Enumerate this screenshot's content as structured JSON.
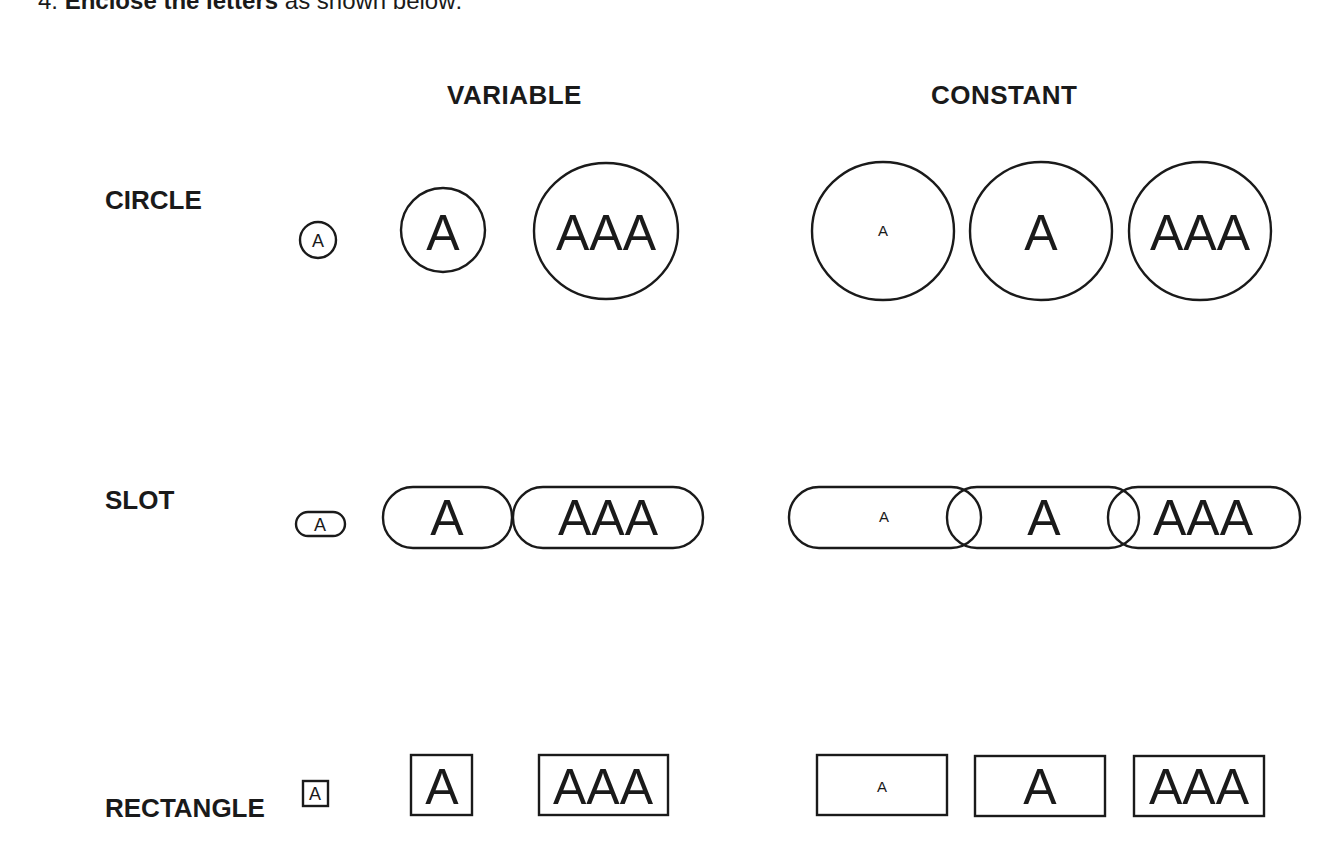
{
  "instruction": {
    "number": "4.",
    "bold": "Enclose the letters",
    "rest": "as shown below:"
  },
  "columns": {
    "variable": "VARIABLE",
    "constant": "CONSTANT"
  },
  "rows": [
    {
      "label": "CIRCLE"
    },
    {
      "label": "SLOT"
    },
    {
      "label": "RECTANGLE"
    }
  ],
  "samples": {
    "small": "A",
    "single": "A",
    "triple": "AAA"
  }
}
